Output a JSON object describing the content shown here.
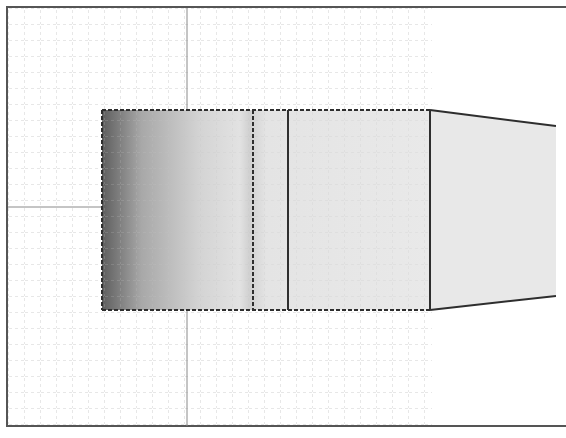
{
  "viewport": {
    "name": "3D model viewport",
    "background": "#ffffff",
    "border_color": "#555555",
    "grid": {
      "color": "#bdbdbd",
      "spacing": 16,
      "extent": {
        "x0": 8,
        "y0": 8,
        "x1": 432,
        "y1": 426
      },
      "axis_x_y": 207,
      "axis_y_x": 187,
      "axis_color": "#8a8a8a"
    },
    "model": {
      "cylinder": {
        "x0": 102,
        "x1": 430,
        "y0": 110,
        "y1": 310
      },
      "section_lines": [
        {
          "x": 253,
          "style": "dashed"
        },
        {
          "x": 288,
          "style": "solid"
        },
        {
          "x": 430,
          "style": "solid"
        }
      ],
      "cone": {
        "x0": 430,
        "x1": 556,
        "top_y0": 110,
        "top_y1": 126,
        "bottom_y0": 310,
        "bottom_y1": 296
      },
      "edge_color": "#2e2e2e",
      "shade_dark": "#6a6a6a",
      "shade_light": "#f0f0f0"
    }
  }
}
